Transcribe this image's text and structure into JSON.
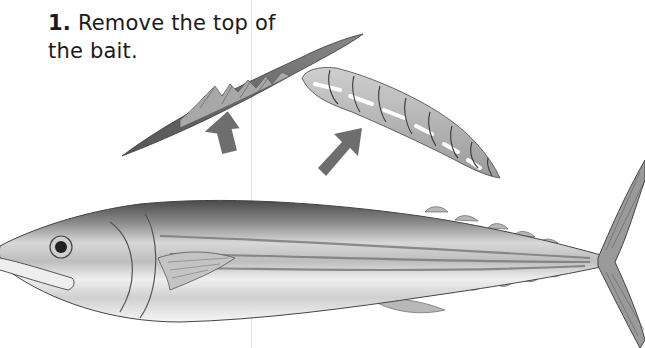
{
  "instruction": {
    "step_number": "1.",
    "text": " Remove the top of the bait."
  },
  "illustration": {
    "subject": "bait-fish",
    "parts": [
      "removed-top-fillet",
      "rigged-bait-core",
      "whole-fish"
    ],
    "arrows": 2,
    "colors": {
      "ink": "#3a3a3a",
      "arrow": "#6e6e6e",
      "fish_back": "#5a5a5a",
      "fish_belly": "#f2f2f2"
    }
  }
}
